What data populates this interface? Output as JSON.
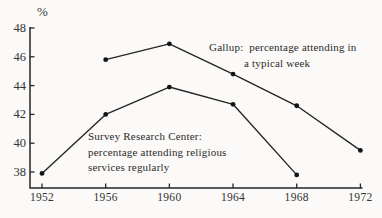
{
  "colors": {
    "ink": "#262626",
    "background": "#fbfaf8",
    "label": "#333333"
  },
  "chart_data": {
    "type": "line",
    "title": "",
    "xlabel": "",
    "ylabel": "%",
    "grid": false,
    "legend": "annotated-on-plot",
    "xlim": [
      1952,
      1972
    ],
    "ylim": [
      38,
      48
    ],
    "x_ticks": [
      1952,
      1956,
      1960,
      1964,
      1968,
      1972
    ],
    "x_tick_labels": [
      "1952",
      "1956",
      "1960",
      "1964",
      "1968",
      "1972"
    ],
    "y_ticks": [
      48,
      46,
      44,
      42,
      40,
      38
    ],
    "y_tick_labels": [
      "48",
      "46",
      "44",
      "42",
      "40",
      "38"
    ],
    "series": [
      {
        "name": "Gallup",
        "label_lines": [
          "Gallup:  percentage attending in",
          "a typical week"
        ],
        "x": [
          1956,
          1960,
          1964,
          1968,
          1972
        ],
        "values": [
          45.8,
          46.9,
          44.8,
          42.6,
          39.5
        ]
      },
      {
        "name": "Survey Research Center",
        "label_lines": [
          "Survey Research Center:",
          "percentage attending religious",
          "services regularly"
        ],
        "x": [
          1952,
          1956,
          1960,
          1964,
          1968
        ],
        "values": [
          37.9,
          42.0,
          43.9,
          42.7,
          37.8
        ]
      }
    ]
  }
}
